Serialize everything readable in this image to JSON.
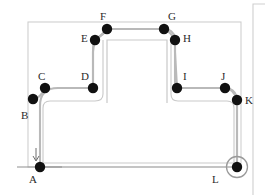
{
  "diagram": {
    "colors": {
      "node_fill": "#111111",
      "path_stroke": "#b9b9b9",
      "obstacle_stroke": "#c9c9c9",
      "boundary_stroke": "#cfcfcf",
      "goal_circle_stroke": "#9a9a9a",
      "label_color": "#2b2b2b",
      "background": "#ffffff"
    },
    "boundary": {
      "x": 28,
      "y": 22,
      "width": 213,
      "height": 145
    },
    "obstacle": {
      "x": 107,
      "y": 40,
      "width": 60,
      "height": 63
    },
    "right_frame": {
      "x": 252,
      "y": 3,
      "width": 13,
      "height": 192
    },
    "node_radius": 5.2,
    "goal_marker": {
      "cx": 237,
      "cy": 167,
      "r": 10.5
    },
    "start_marker": {
      "cx": 40,
      "cy": 167
    },
    "waypoints": [
      {
        "id": "A",
        "x": 40,
        "y": 167,
        "label": "A",
        "label_x": 29,
        "label_y": 174
      },
      {
        "id": "B",
        "x": 33,
        "y": 99,
        "label": "B",
        "label_x": 21,
        "label_y": 110
      },
      {
        "id": "C",
        "x": 45,
        "y": 88,
        "label": "C",
        "label_x": 38,
        "label_y": 71
      },
      {
        "id": "D",
        "x": 93,
        "y": 88,
        "label": "D",
        "label_x": 81,
        "label_y": 71
      },
      {
        "id": "E",
        "x": 95,
        "y": 40,
        "label": "E",
        "label_x": 81,
        "label_y": 36
      },
      {
        "id": "F",
        "x": 107,
        "y": 29,
        "label": "F",
        "label_x": 100,
        "label_y": 12
      },
      {
        "id": "G",
        "x": 164,
        "y": 29,
        "label": "G",
        "label_x": 168,
        "label_y": 12
      },
      {
        "id": "H",
        "x": 175,
        "y": 40,
        "label": "H",
        "label_x": 183,
        "label_y": 36
      },
      {
        "id": "I",
        "x": 177,
        "y": 88,
        "label": "I",
        "label_x": 183,
        "label_y": 71
      },
      {
        "id": "J",
        "x": 225,
        "y": 88,
        "label": "J",
        "label_x": 221,
        "label_y": 71
      },
      {
        "id": "K",
        "x": 237,
        "y": 100,
        "label": "K",
        "label_x": 245,
        "label_y": 96
      },
      {
        "id": "L",
        "x": 237,
        "y": 167,
        "label": "L",
        "label_x": 212,
        "label_y": 174
      }
    ],
    "path_segments": [
      {
        "from": "A",
        "to": "B",
        "kind": "vertical"
      },
      {
        "from": "B",
        "to": "C",
        "kind": "corner"
      },
      {
        "from": "C",
        "to": "D",
        "kind": "horizontal"
      },
      {
        "from": "D",
        "to": "E",
        "kind": "vertical"
      },
      {
        "from": "E",
        "to": "F",
        "kind": "corner"
      },
      {
        "from": "F",
        "to": "G",
        "kind": "horizontal"
      },
      {
        "from": "G",
        "to": "H",
        "kind": "corner"
      },
      {
        "from": "H",
        "to": "I",
        "kind": "vertical"
      },
      {
        "from": "I",
        "to": "J",
        "kind": "horizontal"
      },
      {
        "from": "J",
        "to": "K",
        "kind": "corner"
      },
      {
        "from": "K",
        "to": "L",
        "kind": "vertical"
      }
    ],
    "inner_route": {
      "description": "Inner clearance route traced from A along bottom to L",
      "d": "M 40 167 L 237 167"
    }
  }
}
